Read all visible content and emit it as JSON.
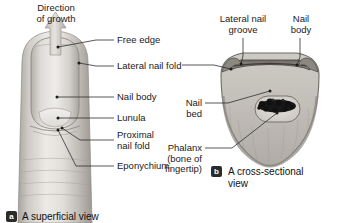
{
  "figure": {
    "panels": [
      {
        "id": "a",
        "badge": "a",
        "caption": "A superficial view",
        "labels": [
          {
            "key": "direction_of_growth",
            "text": "Direction\nof growth"
          },
          {
            "key": "free_edge",
            "text": "Free edge"
          },
          {
            "key": "lateral_nail_fold",
            "text": "Lateral nail fold"
          },
          {
            "key": "nail_body",
            "text": "Nail body"
          },
          {
            "key": "lunula",
            "text": "Lunula"
          },
          {
            "key": "proximal_nail_fold",
            "text": "Proximal\nnail fold"
          },
          {
            "key": "eponychium",
            "text": "Eponychium"
          }
        ]
      },
      {
        "id": "b",
        "badge": "b",
        "caption": "A cross-sectional\nview",
        "labels": [
          {
            "key": "lateral_nail_groove",
            "text": "Lateral nail\ngroove"
          },
          {
            "key": "nail_body",
            "text": "Nail\nbody"
          },
          {
            "key": "nail_bed",
            "text": "Nail\nbed"
          },
          {
            "key": "phalanx",
            "text": "Phalanx\n(bone of\nfingertip)"
          }
        ]
      }
    ],
    "colors": {
      "ink": "#1a1a1a",
      "leader": "#333333",
      "badge_bg": "#2b2b2b",
      "badge_fg": "#ffffff",
      "skin_light": "#e8e6e3",
      "skin_mid": "#c9c5c0",
      "skin_dark": "#9b9791",
      "nail_plate": "#5c5954",
      "bone_dark": "#1d1d1d",
      "background": "#ffffff"
    }
  }
}
